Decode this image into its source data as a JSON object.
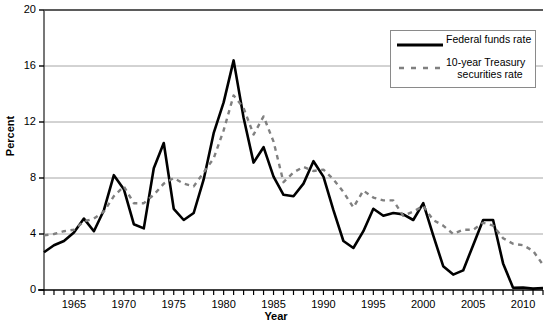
{
  "chart_data": {
    "type": "line",
    "title": "",
    "xlabel": "Year",
    "ylabel": "Percent",
    "xlim": [
      1962,
      2012
    ],
    "ylim": [
      0,
      20
    ],
    "yticks": [
      0,
      4,
      8,
      12,
      16,
      20
    ],
    "xticks": [
      1965,
      1970,
      1975,
      1980,
      1985,
      1990,
      1995,
      2000,
      2005,
      2010
    ],
    "x_tick_interval": 1,
    "grid": "horizontal",
    "legend_position": "top-right",
    "x": [
      1962,
      1963,
      1964,
      1965,
      1966,
      1967,
      1968,
      1969,
      1970,
      1971,
      1972,
      1973,
      1974,
      1975,
      1976,
      1977,
      1978,
      1979,
      1980,
      1981,
      1982,
      1983,
      1984,
      1985,
      1986,
      1987,
      1988,
      1989,
      1990,
      1991,
      1992,
      1993,
      1994,
      1995,
      1996,
      1997,
      1998,
      1999,
      2000,
      2001,
      2002,
      2003,
      2004,
      2005,
      2006,
      2007,
      2008,
      2009,
      2010,
      2011,
      2012
    ],
    "series": [
      {
        "name": "Federal funds rate",
        "color": "#000000",
        "style": "solid",
        "values": [
          2.7,
          3.2,
          3.5,
          4.1,
          5.1,
          4.2,
          5.7,
          8.2,
          7.2,
          4.7,
          4.4,
          8.7,
          10.5,
          5.8,
          5.0,
          5.5,
          7.9,
          11.2,
          13.4,
          16.4,
          12.3,
          9.1,
          10.2,
          8.1,
          6.8,
          6.7,
          7.6,
          9.2,
          8.1,
          5.7,
          3.5,
          3.0,
          4.2,
          5.8,
          5.3,
          5.5,
          5.4,
          5.0,
          6.2,
          3.9,
          1.7,
          1.1,
          1.4,
          3.2,
          5.0,
          5.0,
          1.9,
          0.16,
          0.18,
          0.1,
          0.14
        ]
      },
      {
        "name": "10-year Treasury securities rate",
        "color": "#808080",
        "style": "dashed",
        "values": [
          3.9,
          4.0,
          4.2,
          4.3,
          4.9,
          5.1,
          5.6,
          6.7,
          7.4,
          6.2,
          6.2,
          6.8,
          7.6,
          8.0,
          7.6,
          7.4,
          8.4,
          9.4,
          11.4,
          13.9,
          13.0,
          11.1,
          12.4,
          10.6,
          7.7,
          8.4,
          8.8,
          8.5,
          8.6,
          7.9,
          7.0,
          5.9,
          7.1,
          6.6,
          6.4,
          6.4,
          5.3,
          5.6,
          6.0,
          5.0,
          4.6,
          4.0,
          4.3,
          4.3,
          4.8,
          4.6,
          3.7,
          3.3,
          3.2,
          2.8,
          1.8
        ]
      }
    ]
  },
  "axes": {
    "y_title": "Percent",
    "x_title": "Year",
    "y_tick_labels": [
      "20",
      "16",
      "12",
      "8",
      "4",
      "0"
    ],
    "x_tick_labels": [
      "1965",
      "1970",
      "1975",
      "1980",
      "1985",
      "1990",
      "1995",
      "2000",
      "2005",
      "2010"
    ]
  },
  "legend": {
    "items": [
      {
        "label": "Federal funds rate",
        "label_line1": "Federal funds rate",
        "label_line2": ""
      },
      {
        "label": "10-year Treasury securities rate",
        "label_line1": "10-year Treasury",
        "label_line2": "securities rate"
      }
    ]
  },
  "colors": {
    "federal_funds": "#000000",
    "treasury": "#808080",
    "gridline": "#a6a6a6",
    "axis": "#000000",
    "background": "#ffffff"
  }
}
